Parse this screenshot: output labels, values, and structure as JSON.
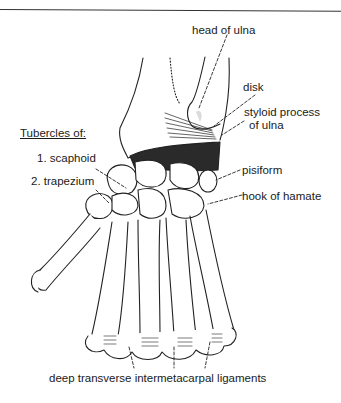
{
  "figure": {
    "group_heading": "Tubercles of:",
    "labels": {
      "head_of_ulna": "head of ulna",
      "disk": "disk",
      "styloid_line1": "styloid process",
      "styloid_line2": "of ulna",
      "scaphoid": "1. scaphoid",
      "trapezium": "2. trapezium",
      "pisiform": "pisiform",
      "hook_of_hamate": "hook of hamate",
      "ligaments": "deep transverse intermetacarpal ligaments"
    }
  }
}
